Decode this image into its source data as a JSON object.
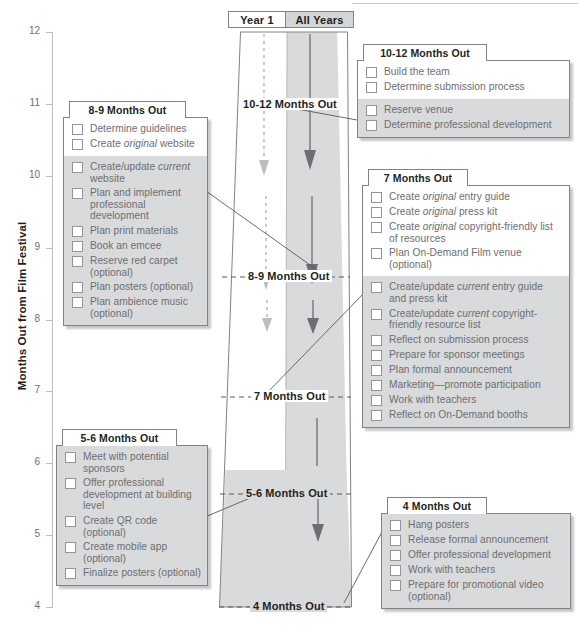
{
  "axis": {
    "title": "Months Out from Film Festival",
    "ticks": [
      "12",
      "11",
      "10",
      "9",
      "8",
      "7",
      "6",
      "5",
      "4"
    ],
    "range": [
      4,
      12
    ]
  },
  "header": {
    "year1_label": "Year 1",
    "all_years_label": "All Years"
  },
  "stage_labels": [
    {
      "text": "10-12 Months Out"
    },
    {
      "text": "8-9 Months Out"
    },
    {
      "text": "7 Months Out"
    },
    {
      "text": "5-6 Months Out"
    },
    {
      "text": "4 Months Out"
    }
  ],
  "colors": {
    "grey_fill": "#d9dadb",
    "band_fill": "#d4d5d6",
    "outline": "#808285",
    "text": "#6d6e71",
    "heading": "#231f20",
    "year1_arrow": "#b5b6b8",
    "allyears_arrow": "#6d6e71"
  },
  "panels": [
    {
      "id": "p-8-9",
      "title": "8-9 Months Out",
      "sections": [
        {
          "shade": "white",
          "tasks": [
            "Determine guidelines",
            "Create <em>original</em> website"
          ]
        },
        {
          "shade": "grey",
          "tasks": [
            "Create/update <em>current</em> website",
            "Plan and implement professional development",
            "Plan print materials",
            "Book an emcee",
            "Reserve red carpet (optional)",
            "Plan posters (optional)",
            "Plan ambience music (optional)"
          ]
        }
      ]
    },
    {
      "id": "p-5-6",
      "title": "5-6 Months Out",
      "sections": [
        {
          "shade": "grey",
          "tasks": [
            "Meet with potential sponsors",
            "Offer professional development at building level",
            "Create QR code (optional)",
            "Create mobile app (optional)",
            "Finalize posters (optional)"
          ]
        }
      ]
    },
    {
      "id": "p-10-12",
      "title": "10-12 Months Out",
      "sections": [
        {
          "shade": "white",
          "tasks": [
            "Build the team",
            "Determine submission process"
          ]
        },
        {
          "shade": "grey",
          "tasks": [
            "Reserve venue",
            "Determine professional development"
          ]
        }
      ]
    },
    {
      "id": "p-7",
      "title": "7 Months Out",
      "sections": [
        {
          "shade": "white",
          "tasks": [
            "Create <em>original</em> entry guide",
            "Create <em>original</em> press kit",
            "Create <em>original</em> copyright-friendly list of resources",
            "Plan On-Demand Film venue (optional)"
          ]
        },
        {
          "shade": "grey",
          "tasks": [
            "Create/update <em>current</em> entry guide and press kit",
            "Create/update <em>current</em> copyright-friendly resource list",
            "Reflect on submission process",
            "Prepare for sponsor meetings",
            "Plan formal announcement",
            "Marketing&mdash;promote participation",
            "Work with teachers",
            "Reflect on On-Demand booths"
          ]
        }
      ]
    },
    {
      "id": "p-4",
      "title": "4 Months Out",
      "sections": [
        {
          "shade": "grey",
          "tasks": [
            "Hang posters",
            "Release formal announcement",
            "Offer professional development",
            "Work with teachers",
            "Prepare for promotional video (optional)"
          ]
        }
      ]
    }
  ]
}
